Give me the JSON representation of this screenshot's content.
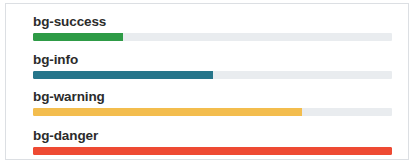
{
  "panel": {
    "border_color": "#dcdfe3",
    "background": "#ffffff"
  },
  "track": {
    "background": "#e9ecef",
    "width_px": 359,
    "height_px": 8
  },
  "progress_bars": [
    {
      "label": "bg-success",
      "value": 25,
      "value_text": "25%",
      "color": "#2e9b46",
      "fill_width_px": 90
    },
    {
      "label": "bg-info",
      "value": 50,
      "value_text": "50%",
      "color": "#26758a",
      "fill_width_px": 180
    },
    {
      "label": "bg-warning",
      "value": 75,
      "value_text": "75%",
      "color": "#f3bd4e",
      "fill_width_px": 269
    },
    {
      "label": "bg-danger",
      "value": 100,
      "value_text": "100%",
      "color": "#ee4a33",
      "fill_width_px": 359
    }
  ]
}
